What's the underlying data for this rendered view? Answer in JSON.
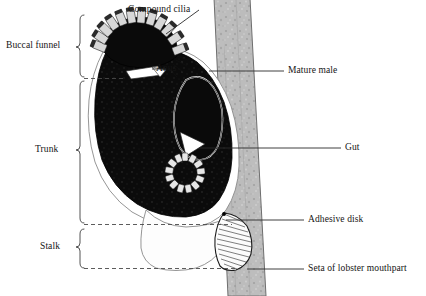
{
  "figure": {
    "background_color": "#ffffff",
    "ink_color": "#141414",
    "body_fill": "#0d0d0d",
    "seta_fill": "#b8b8b8",
    "outline_color": "#3a3a3a"
  },
  "labels": {
    "compound_cilia": "Compound cilia",
    "anus": "Anus",
    "mature_male": "Mature male",
    "gut": "Gut",
    "adhesive_disk": "Adhesive disk",
    "seta": "Seta of lobster mouthpart"
  },
  "brackets": {
    "buccal_funnel": "Buccal funnel",
    "trunk": "Trunk",
    "stalk": "Stalk"
  },
  "structures": {
    "compound_cilia_segments": 12,
    "gut_cells": 13,
    "adhesive_disk_rays": 26
  }
}
